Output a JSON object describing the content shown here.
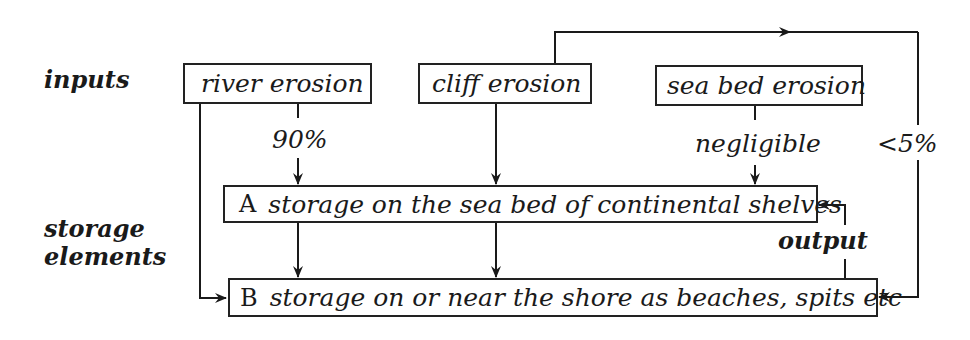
{
  "row_labels": {
    "inputs": "inputs",
    "storage_line1": "storage",
    "storage_line2": "elements"
  },
  "inputs": [
    {
      "id": "river",
      "label": "river erosion"
    },
    {
      "id": "cliff",
      "label": "cliff erosion"
    },
    {
      "id": "seabed",
      "label": "sea bed erosion"
    }
  ],
  "storage": {
    "a": {
      "letter": "A",
      "label": "storage on the sea bed of continental shelves"
    },
    "b": {
      "letter": "B",
      "label": "storage on or near the shore as beaches, spits etc"
    }
  },
  "flows": {
    "river_to_a": "90%",
    "seabed_to_a": "negligible",
    "cliff_to_b": "<5%",
    "b_to_a": "output"
  },
  "colors": {
    "ink": "#1a1a1a",
    "background": "#ffffff"
  }
}
